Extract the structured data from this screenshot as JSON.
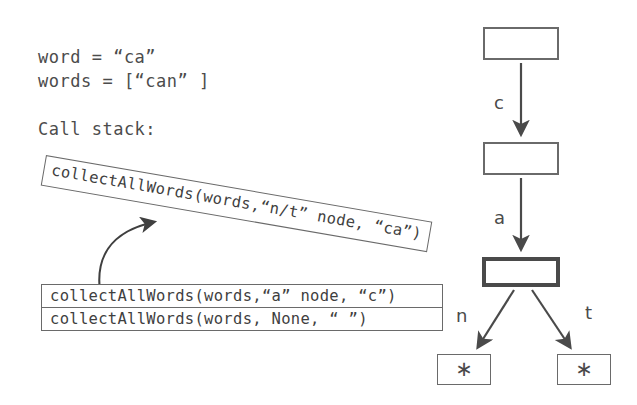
{
  "variables": {
    "word_line": "word = “ca”",
    "words_line": "words = [“can” ]"
  },
  "call_stack": {
    "label": "Call stack:",
    "popped_frame": "collectAllWords(words,“n/t” node, “ca”)",
    "frames": [
      "collectAllWords(words,“a” node, “c”)",
      "collectAllWords(words, None, “ ”)"
    ]
  },
  "trie": {
    "nodes": [
      {
        "id": "root",
        "label": "",
        "style": "plain"
      },
      {
        "id": "c-node",
        "label": "",
        "style": "plain"
      },
      {
        "id": "a-node",
        "label": "",
        "style": "active"
      },
      {
        "id": "n-leaf",
        "label": "∗",
        "style": "leaf"
      },
      {
        "id": "t-leaf",
        "label": "∗",
        "style": "leaf"
      }
    ],
    "edges": [
      {
        "from": "root",
        "to": "c-node",
        "label": "c"
      },
      {
        "from": "c-node",
        "to": "a-node",
        "label": "a"
      },
      {
        "from": "a-node",
        "to": "n-leaf",
        "label": "n"
      },
      {
        "from": "a-node",
        "to": "t-leaf",
        "label": "t"
      }
    ]
  },
  "colors": {
    "background": "#ffffff",
    "stroke": "#6a6a6a",
    "active_stroke": "#4a4a4a",
    "text": "#4c4c4c"
  }
}
